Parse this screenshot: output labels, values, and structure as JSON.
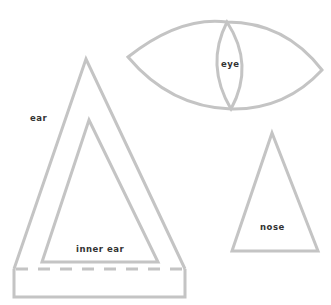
{
  "diagram": {
    "stroke_color": "#c4c4c4",
    "label_color": "#333333",
    "parts": [
      {
        "id": "eye",
        "label": "eye"
      },
      {
        "id": "ear",
        "label": "ear"
      },
      {
        "id": "inner-ear",
        "label": "inner ear"
      },
      {
        "id": "nose",
        "label": "nose"
      }
    ]
  }
}
